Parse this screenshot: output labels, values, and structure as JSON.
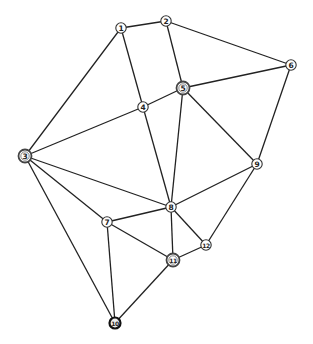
{
  "graph": {
    "nodes": [
      {
        "id": "1",
        "label": "1",
        "x": 121,
        "y": 28,
        "style": "plain"
      },
      {
        "id": "2",
        "label": "2",
        "x": 166,
        "y": 21,
        "style": "plain"
      },
      {
        "id": "3",
        "label": "3",
        "x": 25,
        "y": 156,
        "style": "double"
      },
      {
        "id": "4",
        "label": "4",
        "x": 143,
        "y": 107,
        "style": "plain"
      },
      {
        "id": "5",
        "label": "5",
        "x": 183,
        "y": 88,
        "style": "double"
      },
      {
        "id": "6",
        "label": "6",
        "x": 291,
        "y": 65,
        "style": "plain"
      },
      {
        "id": "7",
        "label": "7",
        "x": 107,
        "y": 222,
        "style": "plain"
      },
      {
        "id": "8",
        "label": "8",
        "x": 171,
        "y": 207,
        "style": "plain"
      },
      {
        "id": "9",
        "label": "9",
        "x": 257,
        "y": 164,
        "style": "plain"
      },
      {
        "id": "10",
        "label": "10",
        "x": 115,
        "y": 323,
        "style": "dark"
      },
      {
        "id": "11",
        "label": "11",
        "x": 173,
        "y": 260,
        "style": "double"
      },
      {
        "id": "12",
        "label": "12",
        "x": 206,
        "y": 245,
        "style": "plain"
      }
    ],
    "edges": [
      [
        "1",
        "2"
      ],
      [
        "1",
        "3"
      ],
      [
        "1",
        "4"
      ],
      [
        "2",
        "5"
      ],
      [
        "2",
        "6"
      ],
      [
        "3",
        "4"
      ],
      [
        "3",
        "8"
      ],
      [
        "3",
        "7"
      ],
      [
        "3",
        "10"
      ],
      [
        "4",
        "5"
      ],
      [
        "4",
        "8"
      ],
      [
        "5",
        "6"
      ],
      [
        "5",
        "8"
      ],
      [
        "5",
        "9"
      ],
      [
        "6",
        "9"
      ],
      [
        "7",
        "8"
      ],
      [
        "7",
        "11"
      ],
      [
        "7",
        "10"
      ],
      [
        "8",
        "9"
      ],
      [
        "8",
        "11"
      ],
      [
        "8",
        "12"
      ],
      [
        "9",
        "12"
      ],
      [
        "11",
        "12"
      ],
      [
        "11",
        "10"
      ]
    ]
  }
}
